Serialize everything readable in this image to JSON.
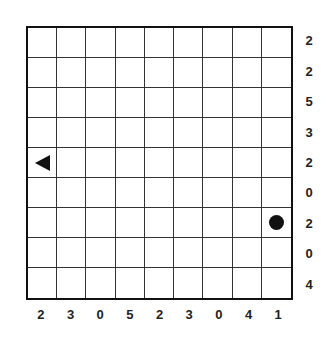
{
  "puzzle": {
    "rows": 9,
    "cols": 9,
    "row_clues": [
      "2",
      "2",
      "5",
      "3",
      "2",
      "0",
      "2",
      "0",
      "4"
    ],
    "col_clues": [
      "2",
      "3",
      "0",
      "5",
      "2",
      "3",
      "0",
      "4",
      "1"
    ],
    "pieces": [
      {
        "type": "triangle-left",
        "row": 4,
        "col": 0
      },
      {
        "type": "circle",
        "row": 6,
        "col": 8
      }
    ],
    "colors": {
      "line": "#333333",
      "piece": "#111111",
      "background": "#ffffff"
    }
  }
}
